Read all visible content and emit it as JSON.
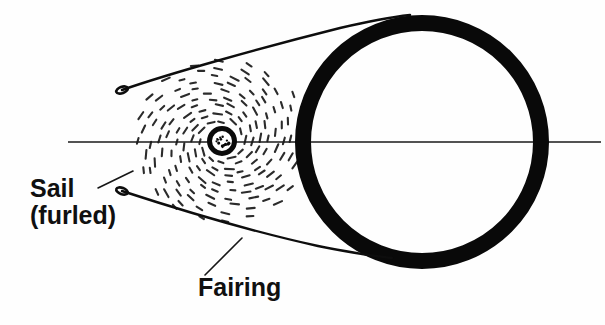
{
  "figure": {
    "kind": "technical-line-drawing",
    "background_color": "#fefefe",
    "ink_color": "#0a0a0a",
    "width": 605,
    "height": 325
  },
  "labels": {
    "sail": {
      "line1": "Sail",
      "line2": "(furled)",
      "x": 30,
      "y": 197,
      "line2_y": 224
    },
    "fairing": {
      "text": "Fairing",
      "x": 198,
      "y": 296
    }
  },
  "leaders": [
    {
      "name": "sail-leader",
      "from_x": 98,
      "from_y": 188,
      "to_x": 133,
      "to_y": 171
    },
    {
      "name": "fairing-leader",
      "from_x": 205,
      "from_y": 275,
      "to_x": 242,
      "to_y": 238
    }
  ],
  "centerline": {
    "name": "axis-centerline",
    "x1": 68,
    "x2": 601,
    "y": 142,
    "stroke_width": 1.5,
    "color": "#1a1a1a"
  },
  "ring": {
    "name": "sail-boom-ring",
    "center_x": 422,
    "center_y": 142,
    "outer_radius": 127,
    "stroke_width": 16,
    "color": "#090909"
  },
  "hub": {
    "name": "spacecraft-hub",
    "center_x": 222,
    "center_y": 141,
    "outer_radius": 15,
    "stroke_width": 5,
    "speck_count": 14,
    "color": "#0a0a0a"
  },
  "fairing": {
    "upper": {
      "name": "fairing-upper-curve",
      "tip_x": 122,
      "tip_y": 90,
      "path": "M122,90 C168,74 260,48 340,28 C370,21 392,17 410,15",
      "stroke_width": 2.4
    },
    "lower": {
      "name": "fairing-lower-curve",
      "tip_x": 122,
      "tip_y": 191,
      "path": "M122,191 C168,206 250,231 318,246 C348,252 372,256 392,258",
      "stroke_width": 2.4
    }
  },
  "sail_wrap": {
    "name": "furled-sail-dash-field",
    "description": "concentric spiral rings of short dashes representing furled sail material",
    "center_x": 222,
    "center_y": 141,
    "rings": [
      {
        "radius": 22,
        "dashes": 12
      },
      {
        "radius": 30,
        "dashes": 14
      },
      {
        "radius": 38,
        "dashes": 16
      },
      {
        "radius": 46,
        "dashes": 18
      },
      {
        "radius": 54,
        "dashes": 20
      },
      {
        "radius": 62,
        "dashes": 22
      },
      {
        "radius": 70,
        "dashes": 22
      },
      {
        "radius": 78,
        "dashes": 22
      },
      {
        "radius": 86,
        "dashes": 20
      }
    ],
    "dash_length": 7,
    "stroke_width": 2.1,
    "color": "#2b2b2b",
    "squash_y": 0.92
  }
}
